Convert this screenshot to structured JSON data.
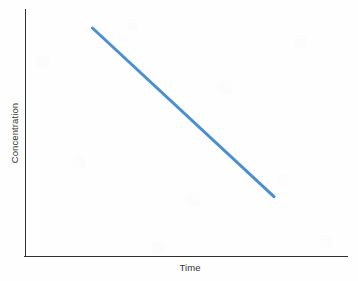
{
  "chart_data": {
    "type": "line",
    "title": "",
    "subtitle": "",
    "xlabel": "Time",
    "ylabel": "Concentration",
    "legend": [],
    "legend_position": "none",
    "grid": false,
    "axis_ticks": false,
    "tick_labels_x": [],
    "tick_labels_y": [],
    "xlim": [
      0,
      1
    ],
    "ylim": [
      0,
      1
    ],
    "annotations": [],
    "series": [
      {
        "name": "zero-order decay",
        "color": "#4a8fd2",
        "line_width": 3,
        "x": [
          0.127,
          1.0
        ],
        "y": [
          1.0,
          0.135
        ],
        "points": [
          {
            "x": 0.127,
            "y": 1.0
          },
          {
            "x": 1.0,
            "y": 0.135
          }
        ]
      }
    ]
  },
  "figure": {
    "background_color": "#fefefe",
    "axis_color": "#2f2f2f",
    "text_color": "#333333",
    "accent_color": "#4a8fd2"
  },
  "axes": {
    "x_axis_name": "Time",
    "y_axis_name": "Concentration"
  }
}
